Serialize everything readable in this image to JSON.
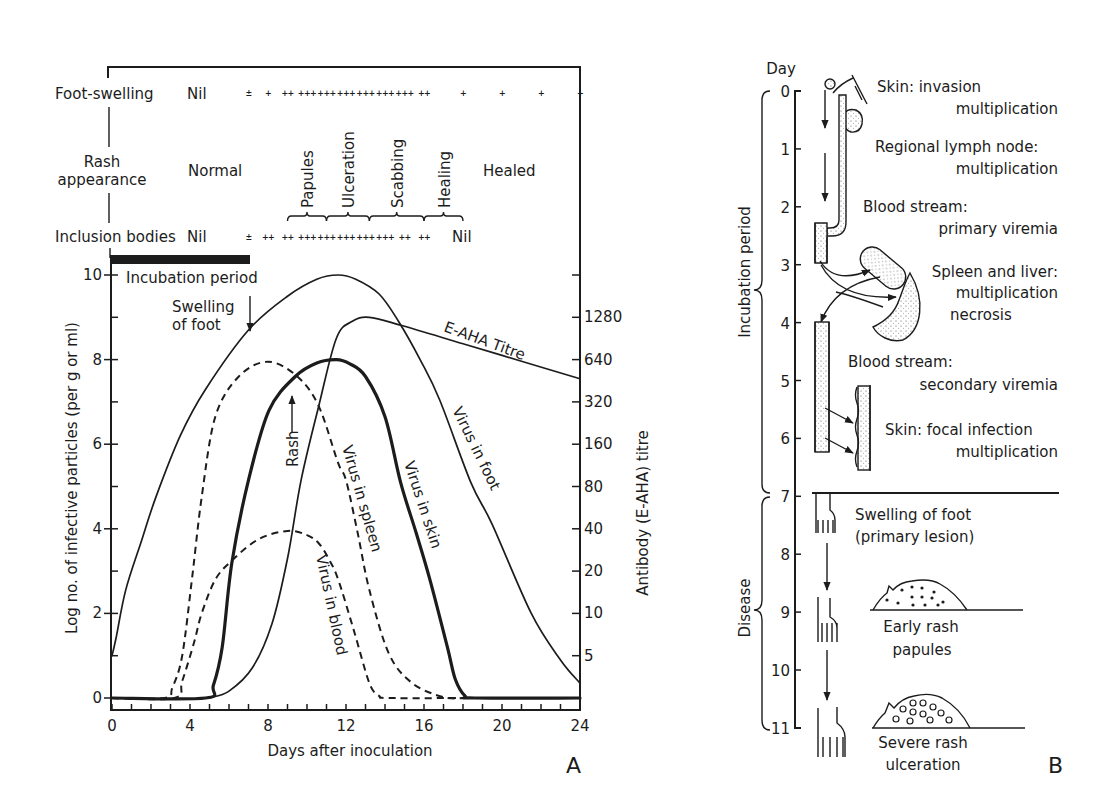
{
  "panel_a": {
    "label": "A",
    "foot_swelling": {
      "label": "Foot-swelling",
      "baseline_value": "Nil",
      "scores": [
        {
          "day": 7,
          "score": "±"
        },
        {
          "day": 8,
          "score": "+"
        },
        {
          "day": 9,
          "score": "++"
        },
        {
          "day": 10,
          "score": "+++"
        },
        {
          "day": 11,
          "score": "+++"
        },
        {
          "day": 12,
          "score": "+++"
        },
        {
          "day": 13,
          "score": "+++"
        },
        {
          "day": 14,
          "score": "+++"
        },
        {
          "day": 15,
          "score": "+++"
        },
        {
          "day": 16,
          "score": "++"
        },
        {
          "day": 18,
          "score": "+"
        },
        {
          "day": 20,
          "score": "+"
        },
        {
          "day": 22,
          "score": "+"
        },
        {
          "day": 24,
          "score": "+"
        }
      ]
    },
    "rash_appearance": {
      "label_line1": "Rash",
      "label_line2": "appearance",
      "before": "Normal",
      "after": "Healed",
      "stages": [
        {
          "label": "Papules",
          "from": 9,
          "to": 11
        },
        {
          "label": "Ulceration",
          "from": 11,
          "to": 13.2
        },
        {
          "label": "Scabbing",
          "from": 13.2,
          "to": 16
        },
        {
          "label": "Healing",
          "from": 16,
          "to": 18
        }
      ]
    },
    "inclusion_bodies": {
      "label": "Inclusion bodies",
      "before": "Nil",
      "after": "Nil",
      "scores": [
        {
          "day": 7,
          "score": "±"
        },
        {
          "day": 8,
          "score": "++"
        },
        {
          "day": 9,
          "score": "++"
        },
        {
          "day": 10,
          "score": "+++"
        },
        {
          "day": 11,
          "score": "+++"
        },
        {
          "day": 12,
          "score": "+++"
        },
        {
          "day": 13,
          "score": "+++"
        },
        {
          "day": 14,
          "score": "+++"
        },
        {
          "day": 15,
          "score": "++"
        },
        {
          "day": 16,
          "score": "++"
        }
      ]
    },
    "annotations": {
      "incubation_period": "Incubation period",
      "swelling_line1": "Swelling",
      "swelling_line2": "of foot",
      "rash": "Rash",
      "titre": "E-AHA Titre",
      "virus_foot": "Virus in foot",
      "virus_skin": "Virus in skin",
      "virus_spleen": "Virus in spleen",
      "virus_blood": "Virus in blood"
    }
  },
  "panel_b": {
    "label": "B",
    "axis_title": "Day",
    "days": [
      "0",
      "1",
      "2",
      "3",
      "4",
      "5",
      "6",
      "7",
      "8",
      "9",
      "10",
      "11"
    ],
    "phases": {
      "incubation": "Incubation period",
      "disease": "Disease"
    },
    "stages": [
      {
        "line1": "Skin: invasion",
        "line2": "multiplication"
      },
      {
        "line1": "Regional lymph node:",
        "line2": "multiplication"
      },
      {
        "line1": "Blood stream:",
        "line2": "primary viremia"
      },
      {
        "line1": "Spleen and liver:",
        "line2": "multiplication",
        "line3": "necrosis"
      },
      {
        "line1": "Blood stream:",
        "line2": "secondary viremia"
      },
      {
        "line1": "Skin: focal infection",
        "line2": "multiplication"
      },
      {
        "line1": "Swelling of foot",
        "line2": "(primary lesion)"
      },
      {
        "line1": "Early rash",
        "line2": "papules"
      },
      {
        "line1": "Severe rash",
        "line2": "ulceration"
      }
    ]
  },
  "chart_data": {
    "type": "line",
    "title": "",
    "xlabel": "Days after inoculation",
    "ylabel": "Log no. of infective particles (per g or ml)",
    "y2label": "Antibody (E-AHA) titre",
    "xlim": [
      0,
      24
    ],
    "ylim": [
      0,
      10
    ],
    "xticks": [
      0,
      4,
      8,
      12,
      16,
      20,
      24
    ],
    "yticks": [
      0,
      2,
      4,
      6,
      8,
      10
    ],
    "y2ticks": [
      "5",
      "10",
      "20",
      "40",
      "80",
      "160",
      "320",
      "640",
      "1280"
    ],
    "y2scale": "log2 (5 at y=1 ... 1280 at y=9)",
    "grid": false,
    "legend": "inline curve labels",
    "series": [
      {
        "id": "foot",
        "name": "Virus in foot",
        "style": "thin-solid",
        "axis": "left",
        "points": [
          [
            0,
            1.0
          ],
          [
            0.2,
            1.4
          ],
          [
            0.7,
            2.55
          ],
          [
            1.5,
            3.7
          ],
          [
            2.25,
            4.75
          ],
          [
            3.5,
            6.2
          ],
          [
            4.8,
            7.3
          ],
          [
            7,
            8.7
          ],
          [
            9,
            9.5
          ],
          [
            10.5,
            9.9
          ],
          [
            11.6,
            10.0
          ],
          [
            12.5,
            9.9
          ],
          [
            13.7,
            9.55
          ],
          [
            14.7,
            8.9
          ],
          [
            15.8,
            8.0
          ],
          [
            16.8,
            7.05
          ],
          [
            18.4,
            5.1
          ],
          [
            19.5,
            4.1
          ],
          [
            21.5,
            2.0
          ],
          [
            23,
            0.9
          ],
          [
            24,
            0.35
          ]
        ]
      },
      {
        "id": "spleen",
        "name": "Virus in spleen",
        "style": "dashed",
        "axis": "left",
        "points": [
          [
            0,
            0
          ],
          [
            2.7,
            0
          ],
          [
            3.1,
            0.25
          ],
          [
            3.6,
            1.0
          ],
          [
            4.1,
            2.8
          ],
          [
            4.6,
            4.75
          ],
          [
            5.3,
            6.65
          ],
          [
            6.5,
            7.6
          ],
          [
            8.0,
            7.95
          ],
          [
            9.5,
            7.6
          ],
          [
            10.6,
            6.9
          ],
          [
            11.6,
            5.55
          ],
          [
            12.0,
            5.15
          ],
          [
            12.6,
            3.9
          ],
          [
            13.2,
            2.55
          ],
          [
            14.2,
            1.05
          ],
          [
            15.4,
            0.35
          ],
          [
            17.0,
            0.02
          ],
          [
            18.1,
            0
          ]
        ]
      },
      {
        "id": "blood",
        "name": "Virus in blood",
        "style": "dashed",
        "axis": "left",
        "points": [
          [
            0,
            0
          ],
          [
            3.2,
            0
          ],
          [
            3.6,
            0.4
          ],
          [
            4.2,
            1.3
          ],
          [
            4.6,
            2.0
          ],
          [
            5.3,
            2.8
          ],
          [
            6.15,
            3.25
          ],
          [
            7.5,
            3.75
          ],
          [
            9,
            3.95
          ],
          [
            10.0,
            3.85
          ],
          [
            10.6,
            3.66
          ],
          [
            11.1,
            3.3
          ],
          [
            11.6,
            2.8
          ],
          [
            12.4,
            1.6
          ],
          [
            13.2,
            0.35
          ],
          [
            13.7,
            0.05
          ],
          [
            14.2,
            0
          ],
          [
            18.1,
            0
          ]
        ]
      },
      {
        "id": "skin",
        "name": "Virus in skin",
        "style": "thick-solid",
        "axis": "left",
        "points": [
          [
            0,
            0
          ],
          [
            4.8,
            0
          ],
          [
            5.2,
            0.3
          ],
          [
            5.65,
            1.2
          ],
          [
            6.15,
            3.2
          ],
          [
            7.0,
            5.15
          ],
          [
            8.05,
            6.8
          ],
          [
            9.4,
            7.6
          ],
          [
            10.5,
            7.92
          ],
          [
            11.5,
            8.0
          ],
          [
            12.2,
            7.9
          ],
          [
            13,
            7.6
          ],
          [
            14,
            6.65
          ],
          [
            14.8,
            5.1
          ],
          [
            15.6,
            3.9
          ],
          [
            16.3,
            2.8
          ],
          [
            17.2,
            1.2
          ],
          [
            17.6,
            0.45
          ],
          [
            18.1,
            0.05
          ],
          [
            18.6,
            0
          ],
          [
            24,
            0
          ]
        ]
      },
      {
        "id": "titre",
        "name": "E-AHA Titre",
        "style": "thin-solid",
        "axis": "right",
        "points": [
          [
            5,
            2.5
          ],
          [
            6,
            2.8
          ],
          [
            7.2,
            4.1
          ],
          [
            8.2,
            8.4
          ],
          [
            9,
            24.6
          ],
          [
            9.7,
            88.8
          ],
          [
            10.6,
            298
          ],
          [
            11.5,
            905
          ],
          [
            12.3,
            1194
          ],
          [
            13.2,
            1280
          ],
          [
            14.9,
            1114
          ],
          [
            18,
            829
          ],
          [
            21,
            623
          ],
          [
            24,
            468
          ]
        ]
      }
    ],
    "annotations": [
      {
        "text": "Incubation period",
        "x_range": [
          0,
          7
        ]
      },
      {
        "text": "Swelling of foot",
        "x": 7,
        "arrow": "down"
      },
      {
        "text": "Rash",
        "x": 9.2,
        "arrow": "up"
      }
    ]
  }
}
